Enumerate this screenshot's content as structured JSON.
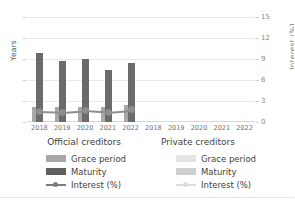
{
  "chart_data": {
    "type": "bar",
    "title": "",
    "subtitle": "",
    "categories": [
      "2018",
      "2019",
      "2020",
      "2021",
      "2022"
    ],
    "panels": [
      {
        "name": "Official creditors",
        "has_data": true,
        "series": [
          {
            "name": "Grace period",
            "type": "bar",
            "unit": "Years",
            "axis": "left",
            "color": "#a8a8a8",
            "values": [
              7,
              7,
              7,
              7,
              8
            ]
          },
          {
            "name": "Maturity",
            "type": "bar",
            "unit": "Years",
            "axis": "left",
            "color": "#6b6b6b",
            "values": [
              33,
              29,
              30,
              25,
              28
            ]
          },
          {
            "name": "Interest (%)",
            "type": "line",
            "unit": "%",
            "axis": "right",
            "color": "#8e8e8e",
            "values": [
              1.6,
              1.5,
              1.7,
              1.5,
              1.8
            ]
          }
        ]
      },
      {
        "name": "Private creditors",
        "has_data": false,
        "series": [
          {
            "name": "Grace period",
            "type": "bar",
            "unit": "Years",
            "axis": "left",
            "color": "#ededed",
            "values": [
              null,
              null,
              null,
              null,
              null
            ]
          },
          {
            "name": "Maturity",
            "type": "bar",
            "unit": "Years",
            "axis": "left",
            "color": "#dcdcdc",
            "values": [
              null,
              null,
              null,
              null,
              null
            ]
          },
          {
            "name": "Interest (%)",
            "type": "line",
            "unit": "%",
            "axis": "right",
            "color": "#dddddd",
            "values": [
              null,
              null,
              null,
              null,
              null
            ]
          }
        ]
      }
    ],
    "xlabel": "",
    "ylabel_left": "Years",
    "ylabel_right": "Interest (%)",
    "ylim_left": [
      0,
      50
    ],
    "ylim_right": [
      0,
      15
    ],
    "yticks_left": [
      "0",
      "10",
      "20",
      "30",
      "40",
      "50"
    ],
    "yticks_right": [
      "0",
      "3",
      "6",
      "9",
      "12",
      "15"
    ],
    "grid": true,
    "legend_position": "bottom"
  },
  "axes": {
    "left_title": "Years",
    "right_title": "Interest (%)",
    "left_ticks": [
      "50",
      "40",
      "30",
      "20",
      "10",
      "0"
    ],
    "right_ticks": [
      "15",
      "12",
      "9",
      "6",
      "3",
      "0"
    ]
  },
  "panels": {
    "official": {
      "title": "Official creditors",
      "xticks": [
        "2018",
        "2019",
        "2020",
        "2021",
        "2022"
      ]
    },
    "private": {
      "title": "Private creditors",
      "xticks": [
        "2018",
        "2019",
        "2020",
        "2021",
        "2022"
      ]
    }
  },
  "legend": {
    "official": [
      {
        "label": "Grace period",
        "kind": "bar"
      },
      {
        "label": "Maturity",
        "kind": "bar"
      },
      {
        "label": "Interest (%)",
        "kind": "line"
      }
    ],
    "private": [
      {
        "label": "Grace period",
        "kind": "bar"
      },
      {
        "label": "Maturity",
        "kind": "bar"
      },
      {
        "label": "Interest (%)",
        "kind": "line"
      }
    ]
  },
  "colors": {
    "grace": "#a8a8a8",
    "maturity": "#6b6b6b",
    "interest": "#8e8e8e",
    "grace_faded": "#ededed",
    "maturity_faded": "#dcdcdc",
    "interest_faded": "#dddddd",
    "grid": "#e9e9e9"
  }
}
